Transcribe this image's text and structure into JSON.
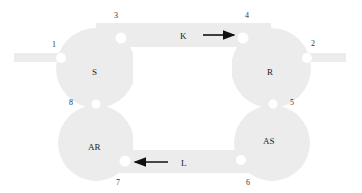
{
  "diagram": {
    "fill_color": "#ececec",
    "hole_color": "#ffffff",
    "arrow_color": "#111111",
    "chambers": [
      {
        "id": "S",
        "label": "S",
        "cx": 96,
        "cy": 68,
        "r": 40
      },
      {
        "id": "R",
        "label": "R",
        "cx": 271,
        "cy": 68,
        "r": 40
      },
      {
        "id": "AR",
        "label": "AR",
        "cx": 96,
        "cy": 143,
        "r": 38
      },
      {
        "id": "AS",
        "label": "AS",
        "cx": 272,
        "cy": 143,
        "r": 38
      }
    ],
    "channels": [
      {
        "id": "K",
        "label": "K",
        "direction": "right"
      },
      {
        "id": "L",
        "label": "L",
        "direction": "left"
      }
    ],
    "ports": [
      {
        "number": "1",
        "x": 61,
        "y": 58
      },
      {
        "number": "2",
        "x": 307,
        "y": 58
      },
      {
        "number": "3",
        "x": 123,
        "y": 39
      },
      {
        "number": "4",
        "x": 241,
        "y": 39
      },
      {
        "number": "5",
        "x": 283,
        "y": 104
      },
      {
        "number": "6",
        "x": 240,
        "y": 160
      },
      {
        "number": "7",
        "x": 127,
        "y": 160
      },
      {
        "number": "8",
        "x": 96,
        "y": 104
      }
    ],
    "port_labels": [
      {
        "text": "1",
        "x": 52,
        "y": 47
      },
      {
        "text": "2",
        "x": 311,
        "y": 46
      },
      {
        "text": "3",
        "x": 114,
        "y": 18
      },
      {
        "text": "4",
        "x": 245,
        "y": 18
      },
      {
        "text": "5",
        "x": 290,
        "y": 105
      },
      {
        "text": "6",
        "x": 246,
        "y": 185
      },
      {
        "text": "7",
        "x": 116,
        "y": 185
      },
      {
        "text": "8",
        "x": 69,
        "y": 105
      }
    ]
  }
}
